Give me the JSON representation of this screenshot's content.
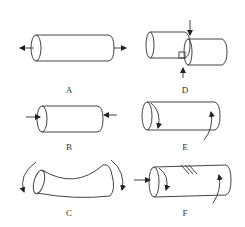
{
  "figure": {
    "panels": [
      {
        "id": "A",
        "label": "A",
        "description": "cylinder with outward arrows at both ends (tension)"
      },
      {
        "id": "B",
        "label": "B",
        "description": "cylinder with inward arrows at both ends (compression)"
      },
      {
        "id": "C",
        "label": "C",
        "description": "curved cylinder with curved arrows at both ends (bending)"
      },
      {
        "id": "D",
        "label": "D",
        "description": "two offset cylinders with opposing vertical arrows (shear)"
      },
      {
        "id": "E",
        "label": "E",
        "description": "cylinder with opposing curved arrows at ends (torsion)"
      },
      {
        "id": "F",
        "label": "F",
        "description": "cylinder with axial arrow, curved arrows and surface lines (combined loading)"
      }
    ],
    "colors": {
      "line": "#333333",
      "background": "#ffffff"
    }
  }
}
